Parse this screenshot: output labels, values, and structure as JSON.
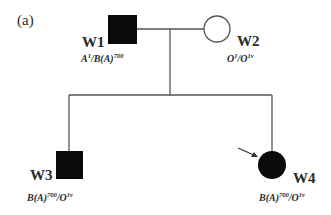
{
  "panel_label": "(a)",
  "colors": {
    "line": "#555555",
    "affected_fill": "#0a0a0a",
    "unaffected_fill": "#ffffff",
    "text": "#2a2a2a"
  },
  "individuals": [
    {
      "id": "W1",
      "sex": "male",
      "affected": true,
      "generation": 1,
      "genotype": {
        "a1": "A",
        "a1_sup": "1",
        "a2": "B(A)",
        "a2_sup": "700"
      }
    },
    {
      "id": "W2",
      "sex": "female",
      "affected": false,
      "generation": 1,
      "genotype": {
        "a1": "O",
        "a1_sup": "1",
        "a2": "O",
        "a2_sup": "1v"
      }
    },
    {
      "id": "W3",
      "sex": "male",
      "affected": true,
      "generation": 2,
      "genotype": {
        "a1": "B(A)",
        "a1_sup": "700",
        "a2": "O",
        "a2_sup": "1v"
      }
    },
    {
      "id": "W4",
      "sex": "female",
      "affected": true,
      "generation": 2,
      "proband": true,
      "genotype": {
        "a1": "B(A)",
        "a1_sup": "700",
        "a2": "O",
        "a2_sup": "1v"
      }
    }
  ],
  "relationships": {
    "mating": [
      "W1",
      "W2"
    ],
    "children": [
      "W3",
      "W4"
    ]
  }
}
